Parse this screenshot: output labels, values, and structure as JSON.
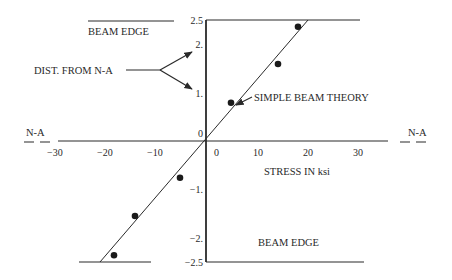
{
  "chart_data": {
    "type": "scatter",
    "title": "",
    "xlabel": "STRESS IN ksi",
    "ylabel": "DIST. FROM N-A",
    "xlim": [
      -30,
      35
    ],
    "ylim": [
      -2.5,
      2.5
    ],
    "grid": false,
    "x_ticks": [
      {
        "value": -30,
        "label": "−30"
      },
      {
        "value": -20,
        "label": "−20"
      },
      {
        "value": -10,
        "label": "−10"
      },
      {
        "value": 0,
        "label": "0"
      },
      {
        "value": 10,
        "label": "10"
      },
      {
        "value": 20,
        "label": "20"
      },
      {
        "value": 30,
        "label": "30"
      }
    ],
    "y_ticks": [
      {
        "value": 2.5,
        "label": "2.5"
      },
      {
        "value": 2,
        "label": "2."
      },
      {
        "value": 1,
        "label": "1."
      },
      {
        "value": 0,
        "label": "0"
      },
      {
        "value": -1,
        "label": "−1."
      },
      {
        "value": -2,
        "label": "−2."
      },
      {
        "value": -2.5,
        "label": "−2.5"
      }
    ],
    "series": [
      {
        "name": "Measured",
        "type": "scatter",
        "points": [
          {
            "x": 18.4,
            "y": 2.36
          },
          {
            "x": 14.4,
            "y": 1.59
          },
          {
            "x": 5.0,
            "y": 0.79
          },
          {
            "x": -5.2,
            "y": -0.76
          },
          {
            "x": -14.2,
            "y": -1.55
          },
          {
            "x": -18.4,
            "y": -2.36
          }
        ]
      },
      {
        "name": "SIMPLE BEAM THEORY",
        "type": "line",
        "points": [
          {
            "x": -21.2,
            "y": -2.5
          },
          {
            "x": 20.4,
            "y": 2.5
          }
        ]
      }
    ],
    "annotations": {
      "beam_edge_top": "BEAM EDGE",
      "beam_edge_bottom": "BEAM EDGE",
      "dist_from_na": "DIST. FROM N-A",
      "simple_beam_theory": "SIMPLE BEAM THEORY",
      "na_left": "N-A",
      "na_right": "N-A"
    }
  }
}
